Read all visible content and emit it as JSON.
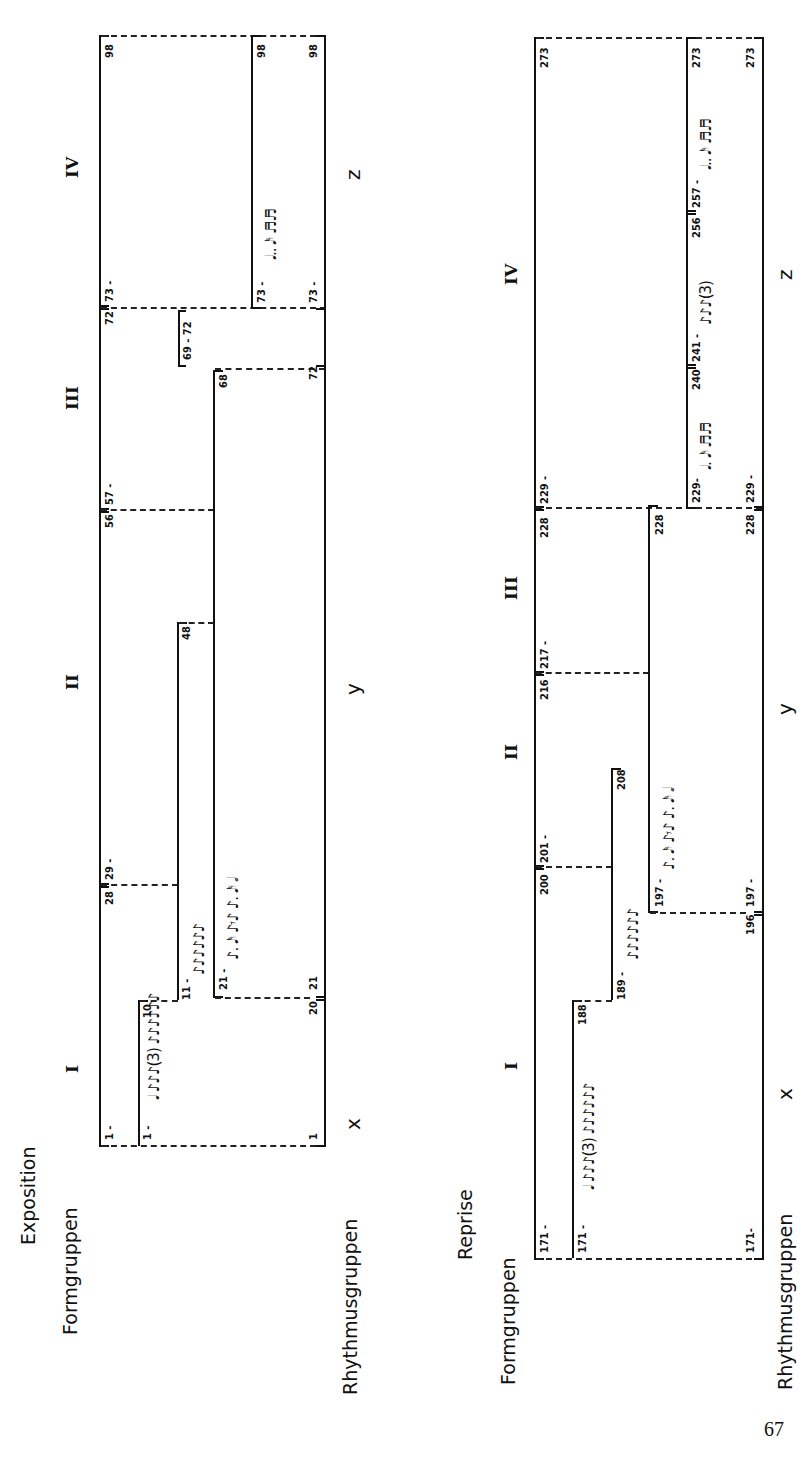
{
  "page_number": "67",
  "sections": {
    "exposition": {
      "title": "Exposition",
      "formgruppen_label": "Formgruppen",
      "rhythmusgruppen_label": "Rhythmusgruppen",
      "form_sections": [
        "I",
        "II",
        "III",
        "IV"
      ],
      "rhythm_letters": [
        "x",
        "y",
        "z"
      ],
      "form_groups": [
        {
          "start": "1 -",
          "end": "28"
        },
        {
          "start": "29 -",
          "end": "56"
        },
        {
          "start": "57 -",
          "end": "72"
        },
        {
          "start": "73 -",
          "end": "98"
        }
      ],
      "rhythm_groups": [
        {
          "start": "1 -",
          "end": "10",
          "rhythm": "𝅘𝅥  ♪♪♪(3)  ♪♪♪♪♪♪"
        },
        {
          "start": "11 -",
          "end": "48",
          "rhythm": "♪♪♪♪♪♪"
        },
        {
          "start": "21 -",
          "end": "68",
          "rhythm": "♪. 𝅘𝅥𝅯 ♪𝄾♪ ♪. 𝅘𝅥𝅯 𝅗𝅥"
        },
        {
          "start": "69 - 72",
          "end": ""
        },
        {
          "start": "73 -",
          "end": "98",
          "rhythm": "𝅘𝅥.. 𝅘𝅥𝅯 ♬♬"
        }
      ],
      "bottom_groups": [
        {
          "start": "1",
          "end": "20"
        },
        {
          "start": "21",
          "end": "72"
        },
        {
          "start": "73 -",
          "end": "98"
        }
      ]
    },
    "reprise": {
      "title": "Reprise",
      "formgruppen_label": "Formgruppen",
      "rhythmusgruppen_label": "Rhythmusgruppen",
      "form_sections": [
        "I",
        "II",
        "III",
        "IV"
      ],
      "rhythm_letters": [
        "x",
        "y",
        "z"
      ],
      "form_groups": [
        {
          "start": "171 -",
          "end": "200"
        },
        {
          "start": "201 -",
          "end": "216"
        },
        {
          "start": "217 -",
          "end": "228"
        },
        {
          "start": "229 -",
          "end": "273"
        }
      ],
      "rhythm_groups": [
        {
          "start": "171 -",
          "end": "188",
          "rhythm": "𝅘𝅥  ♪♪♪(3)  ♪♪♪♪♪♪"
        },
        {
          "start": "189 -",
          "end": "208",
          "rhythm": "♪♪♪♪♪♪"
        },
        {
          "start": "197 -",
          "end": "228",
          "rhythm": "♪. 𝅘𝅥𝅯 ♪𝄾♪ ♪. 𝅘𝅥𝅯 𝅗𝅥"
        },
        {
          "start": "229-",
          "end": "240",
          "rhythm": "𝅘𝅥. 𝅘𝅥𝅯 ♬♬"
        },
        {
          "start": "241 -",
          "end": "256",
          "rhythm": "♪♪♪(3)"
        },
        {
          "start": "257 -",
          "end": "273",
          "rhythm": "𝅘𝅥.. 𝅘𝅥𝅯 ♬♬"
        }
      ],
      "bottom_groups": [
        {
          "start": "171-",
          "end": "196"
        },
        {
          "start": "197 -",
          "end": "228"
        },
        {
          "start": "229 -",
          "end": "273"
        }
      ]
    }
  }
}
